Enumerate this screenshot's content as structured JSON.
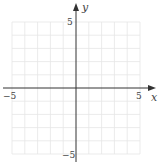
{
  "diagram": {
    "type": "coordinate-grid",
    "x_axis": {
      "label": "x",
      "min": -5,
      "max": 5,
      "tick_labels": [
        "−5",
        "5"
      ]
    },
    "y_axis": {
      "label": "y",
      "min": -5,
      "max": 5,
      "tick_labels": [
        "5",
        "−5"
      ]
    },
    "grid": {
      "step": 1,
      "color": "#e6e6e6"
    },
    "axis_color": "#333333"
  }
}
